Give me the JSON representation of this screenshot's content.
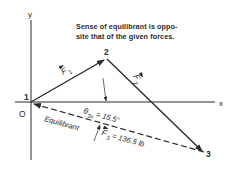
{
  "note": {
    "line1": "Sense of equilibrant is oppo-",
    "line2": "site that of the given forces."
  },
  "axes": {
    "x_label": "x",
    "y_label": "y",
    "origin_label": "O"
  },
  "points": {
    "p1": "1",
    "p2": "2",
    "p3": "3"
  },
  "vectors": {
    "f1": {
      "symbol": "F",
      "subscript": "1"
    },
    "f2": {
      "symbol": "F",
      "subscript": "2"
    },
    "f3": {
      "symbol": "F",
      "subscript": "3",
      "value_text": "= 136.5 lb"
    },
    "equilibrant_label": "Equilibrant"
  },
  "angle": {
    "symbol": "θ",
    "subscript": "3x",
    "value_text": "= 15.5°"
  },
  "colors": {
    "line": "#2a2a2a",
    "background": "#ffffff"
  }
}
